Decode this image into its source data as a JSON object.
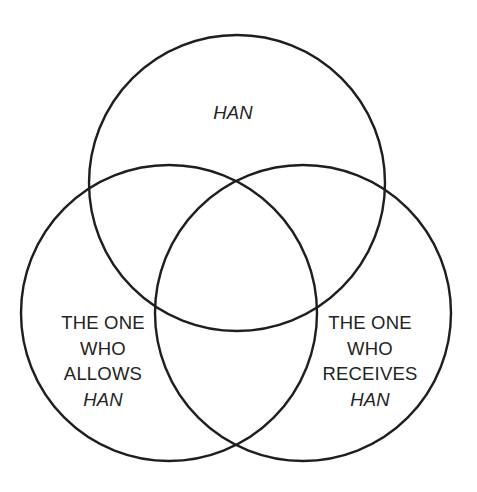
{
  "diagram": {
    "type": "venn",
    "sets": [
      {
        "id": "top",
        "label_lines": [
          "HAN"
        ],
        "italic_lines": [
          0
        ]
      },
      {
        "id": "left",
        "label_lines": [
          "THE ONE",
          "WHO",
          "ALLOWS",
          "HAN"
        ],
        "italic_lines": [
          3
        ]
      },
      {
        "id": "right",
        "label_lines": [
          "THE ONE",
          "WHO",
          "RECEIVES",
          "HAN"
        ],
        "italic_lines": [
          3
        ]
      }
    ],
    "colors": {
      "stroke": "#1e1e1e",
      "text": "#232323",
      "background": "#ffffff"
    }
  }
}
